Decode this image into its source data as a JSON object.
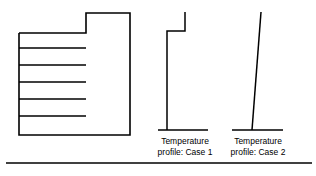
{
  "figure": {
    "background_color": "#ffffff",
    "stroke_color": "#000000",
    "title": "",
    "captions": {
      "case1": {
        "line1": "Temperature",
        "line2": "profile: Case 1"
      },
      "case2": {
        "line1": "Temperature",
        "line2": "profile: Case 2"
      }
    },
    "shapes": {
      "building_section": {
        "name": "building-cross-section",
        "description": "notched rectangle outline with horizontal floor lines",
        "interior_line_count": 5
      },
      "case1_profile": {
        "name": "step-temperature-profile",
        "description": "vertical line with a step to the right near the top"
      },
      "case2_profile": {
        "name": "linear-temperature-profile",
        "description": "single line leaning to the right going upward"
      }
    }
  },
  "chart_data": {
    "type": "line",
    "title": "",
    "xlabel": "",
    "ylabel": "",
    "grid": false,
    "legend": "none",
    "panels": [
      {
        "name": "building-cross-section",
        "type": "outline",
        "outline_points": [
          [
            19,
            33
          ],
          [
            86,
            33
          ],
          [
            86,
            13
          ],
          [
            130,
            13
          ],
          [
            130,
            135
          ],
          [
            19,
            135
          ],
          [
            19,
            33
          ]
        ],
        "interior_lines": [
          [
            [
              19,
              48
            ],
            [
              86,
              48
            ]
          ],
          [
            [
              19,
              65
            ],
            [
              86,
              65
            ]
          ],
          [
            [
              19,
              82
            ],
            [
              86,
              82
            ]
          ],
          [
            [
              19,
              99
            ],
            [
              86,
              99
            ]
          ],
          [
            [
              19,
              116
            ],
            [
              86,
              116
            ]
          ]
        ]
      },
      {
        "name": "temperature-profile-case-1",
        "type": "line",
        "baseline": [
          [
            158,
            130
          ],
          [
            208,
            130
          ]
        ],
        "points": [
          [
            167,
            130
          ],
          [
            167,
            31
          ],
          [
            185,
            31
          ],
          [
            185,
            12
          ]
        ]
      },
      {
        "name": "temperature-profile-case-2",
        "type": "line",
        "baseline": [
          [
            232,
            130
          ],
          [
            283,
            130
          ]
        ],
        "points": [
          [
            252,
            130
          ],
          [
            261,
            12
          ]
        ]
      }
    ],
    "footer_rule": [
      [
        6,
        163
      ],
      [
        312,
        163
      ]
    ]
  }
}
